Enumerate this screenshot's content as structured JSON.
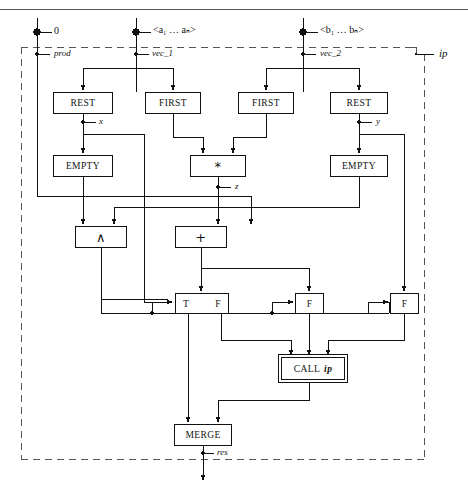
{
  "diagram": {
    "title_rule": true,
    "region_label": "ip",
    "inputs": [
      {
        "id": "in-0",
        "value": "0",
        "port": "prod",
        "x": 37
      },
      {
        "id": "in-vec1",
        "value": "<a₁ … aₙ>",
        "port": "vec_1",
        "x": 136
      },
      {
        "id": "in-vec2",
        "value": "<b₁ … bₙ>",
        "port": "vec_2",
        "x": 303
      }
    ],
    "nodes": [
      {
        "id": "rest-left",
        "label": "REST",
        "x": 53,
        "y": 92,
        "w": 60,
        "h": 22
      },
      {
        "id": "first-left",
        "label": "FIRST",
        "x": 145,
        "y": 92,
        "w": 56,
        "h": 22
      },
      {
        "id": "first-right",
        "label": "FIRST",
        "x": 238,
        "y": 92,
        "w": 56,
        "h": 22
      },
      {
        "id": "rest-right",
        "label": "REST",
        "x": 330,
        "y": 92,
        "w": 58,
        "h": 22
      },
      {
        "id": "empty-left",
        "label": "EMPTY",
        "x": 53,
        "y": 155,
        "w": 60,
        "h": 22
      },
      {
        "id": "mul",
        "label": "*",
        "x": 190,
        "y": 155,
        "w": 56,
        "h": 22
      },
      {
        "id": "empty-right",
        "label": "EMPTY",
        "x": 330,
        "y": 155,
        "w": 58,
        "h": 22
      },
      {
        "id": "and",
        "label": "∧",
        "x": 75,
        "y": 226,
        "w": 52,
        "h": 22
      },
      {
        "id": "plus",
        "label": "+",
        "x": 175,
        "y": 226,
        "w": 52,
        "h": 22
      },
      {
        "id": "merge",
        "label": "MERGE",
        "x": 174,
        "y": 424,
        "w": 58,
        "h": 22
      }
    ],
    "switches": [
      {
        "id": "switch-tf",
        "left": "T",
        "right": "F",
        "x": 175,
        "y": 293,
        "w": 54,
        "h": 21
      },
      {
        "id": "switch-f1",
        "left": "",
        "right": "F",
        "x": 295,
        "y": 293,
        "w": 29,
        "h": 21
      },
      {
        "id": "switch-f2",
        "left": "",
        "right": "F",
        "x": 390,
        "y": 293,
        "w": 29,
        "h": 21
      }
    ],
    "call": {
      "id": "call-ip",
      "prefix": "CALL",
      "name": "ip",
      "x": 281,
      "y": 357,
      "w": 64,
      "h": 23
    },
    "wire_labels": [
      {
        "id": "label-prod",
        "text": "prod",
        "x": 54,
        "y": 48
      },
      {
        "id": "label-vec1",
        "text": "vec_1",
        "x": 152,
        "y": 48
      },
      {
        "id": "label-vec2",
        "text": "vec_2",
        "x": 320,
        "y": 48
      },
      {
        "id": "label-x",
        "text": "x",
        "x": 99,
        "y": 115
      },
      {
        "id": "label-y",
        "text": "y",
        "x": 377,
        "y": 115
      },
      {
        "id": "label-z",
        "text": "z",
        "x": 238,
        "y": 180
      },
      {
        "id": "label-res",
        "text": "res",
        "x": 216,
        "y": 445
      },
      {
        "id": "label-ip",
        "text": "ip",
        "x": 443,
        "y": 45
      }
    ]
  }
}
